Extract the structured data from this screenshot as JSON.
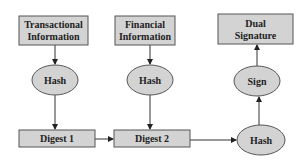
{
  "diagram": {
    "colors": {
      "node_fill": "#d3d3d3",
      "node_stroke": "#555555",
      "edge": "#333333",
      "text": "#222222"
    },
    "nodes": {
      "transactional_info": {
        "shape": "rect",
        "line1": "Transactional",
        "line2": "Information"
      },
      "financial_info": {
        "shape": "rect",
        "line1": "Financial",
        "line2": "Information"
      },
      "dual_signature": {
        "shape": "rect",
        "line1": "Dual",
        "line2": "Signature"
      },
      "hash1": {
        "shape": "ellipse",
        "label": "Hash"
      },
      "hash2": {
        "shape": "ellipse",
        "label": "Hash"
      },
      "sign": {
        "shape": "ellipse",
        "label": "Sign"
      },
      "digest1": {
        "shape": "rect",
        "label": "Digest 1"
      },
      "digest2": {
        "shape": "rect",
        "label": "Digest 2"
      },
      "hash3": {
        "shape": "ellipse",
        "label": "Hash"
      }
    },
    "edges": [
      {
        "from": "transactional_info",
        "to": "hash1"
      },
      {
        "from": "hash1",
        "to": "digest1"
      },
      {
        "from": "financial_info",
        "to": "hash2"
      },
      {
        "from": "hash2",
        "to": "digest2"
      },
      {
        "from": "digest1",
        "to": "digest2"
      },
      {
        "from": "digest2",
        "to": "hash3"
      },
      {
        "from": "hash3",
        "to": "sign"
      },
      {
        "from": "sign",
        "to": "dual_signature"
      }
    ]
  }
}
